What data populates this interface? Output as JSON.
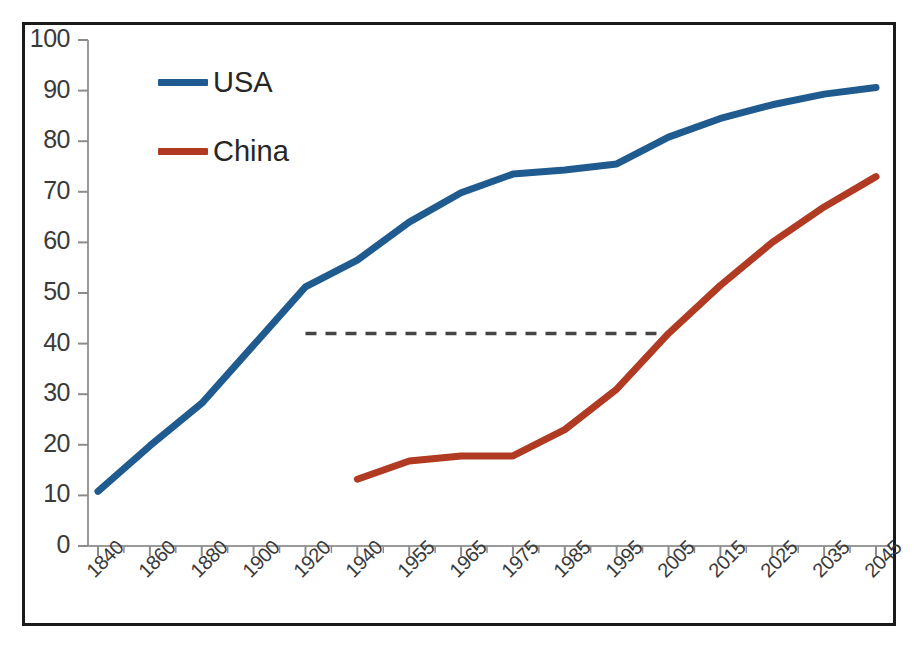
{
  "chart_data": {
    "type": "line",
    "title": "",
    "subtitle": "",
    "xlabel": "",
    "ylabel": "",
    "ylim": [
      0,
      100
    ],
    "ytick_labels": [
      "0",
      "10",
      "20",
      "30",
      "40",
      "50",
      "60",
      "70",
      "80",
      "90",
      "100"
    ],
    "ytick_values": [
      0,
      10,
      20,
      30,
      40,
      50,
      60,
      70,
      80,
      90,
      100
    ],
    "categories": [
      "1840",
      "1860",
      "1880",
      "1900",
      "1920",
      "1940",
      "1955",
      "1965",
      "1975",
      "1985",
      "1995",
      "2005",
      "2015",
      "2025",
      "2035",
      "2045"
    ],
    "grid": false,
    "legend_position": "upper-left-inside",
    "series": [
      {
        "name": "USA",
        "color": "#1F5B8E",
        "values": [
          10.8,
          19.8,
          28.2,
          39.7,
          51.2,
          56.5,
          64.0,
          69.8,
          73.5,
          74.3,
          75.5,
          80.8,
          84.5,
          87.2,
          89.3,
          90.6
        ]
      },
      {
        "name": "China",
        "color": "#B03A22",
        "values": [
          null,
          null,
          null,
          null,
          null,
          13.2,
          16.8,
          17.8,
          17.8,
          23.0,
          31.0,
          42.0,
          51.5,
          60.0,
          67.0,
          73.0
        ]
      }
    ],
    "annotations": [
      {
        "name": "reference-dashed-line",
        "type": "horizontal-dashed-segment",
        "value": 42,
        "x_start": "1920",
        "x_end": "2005",
        "color": "#444444",
        "label": ""
      }
    ]
  },
  "legend": {
    "items": [
      {
        "label": "USA",
        "color": "#1F5B8E"
      },
      {
        "label": "China",
        "color": "#B03A22"
      }
    ]
  },
  "axes": {
    "y_axis_name": "y-axis",
    "x_axis_name": "x-axis",
    "frame_color": "#1a1a1a",
    "tick_color": "#8c8c8c"
  }
}
